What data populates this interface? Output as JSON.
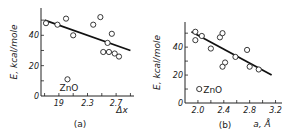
{
  "chart_data": [
    {
      "type": "scatter",
      "panel_label": "(a)",
      "xlabel": "Δx",
      "ylabel": "E, kcal/mole",
      "xlim": [
        1.65,
        2.95
      ],
      "ylim": [
        0,
        58
      ],
      "xticks": [
        1.9,
        2.3,
        2.7
      ],
      "xtick_labels": [
        "19",
        "2.3",
        "2.7"
      ],
      "yticks": [
        0,
        20,
        40
      ],
      "ytick_labels": [
        "0",
        "20",
        "40"
      ],
      "points": [
        {
          "x": 1.72,
          "y": 48
        },
        {
          "x": 1.88,
          "y": 47
        },
        {
          "x": 2.0,
          "y": 51
        },
        {
          "x": 2.1,
          "y": 40
        },
        {
          "x": 2.38,
          "y": 47
        },
        {
          "x": 2.48,
          "y": 52
        },
        {
          "x": 2.58,
          "y": 35
        },
        {
          "x": 2.52,
          "y": 29
        },
        {
          "x": 2.6,
          "y": 29
        },
        {
          "x": 2.64,
          "y": 41
        },
        {
          "x": 2.68,
          "y": 28
        },
        {
          "x": 2.74,
          "y": 26
        }
      ],
      "annotation": {
        "label": "ZnO",
        "x": 2.02,
        "y": 11
      },
      "fit_line": [
        {
          "x": 1.7,
          "y": 50
        },
        {
          "x": 2.9,
          "y": 30
        }
      ],
      "grid": false
    },
    {
      "type": "scatter",
      "panel_label": "(b)",
      "xlabel": "a, Å",
      "ylabel": "E, kcal/mole",
      "xlim": [
        1.8,
        3.3
      ],
      "ylim": [
        0,
        58
      ],
      "xticks": [
        2.0,
        2.4,
        2.8,
        3.2
      ],
      "xtick_labels": [
        "2.0",
        "2.4",
        "2.8",
        "3.2"
      ],
      "yticks": [
        0,
        20,
        40
      ],
      "ytick_labels": [
        "0",
        "20",
        "40"
      ],
      "points": [
        {
          "x": 1.96,
          "y": 51
        },
        {
          "x": 1.96,
          "y": 45
        },
        {
          "x": 2.06,
          "y": 48
        },
        {
          "x": 2.2,
          "y": 39
        },
        {
          "x": 2.34,
          "y": 47
        },
        {
          "x": 2.38,
          "y": 50
        },
        {
          "x": 2.38,
          "y": 26
        },
        {
          "x": 2.42,
          "y": 29
        },
        {
          "x": 2.58,
          "y": 33
        },
        {
          "x": 2.76,
          "y": 38
        },
        {
          "x": 2.8,
          "y": 26
        },
        {
          "x": 2.94,
          "y": 24
        }
      ],
      "annotation": {
        "label": "ZnO",
        "x": 2.02,
        "y": 10
      },
      "fit_line": [
        {
          "x": 1.9,
          "y": 51
        },
        {
          "x": 3.14,
          "y": 20
        }
      ],
      "grid": false
    }
  ]
}
